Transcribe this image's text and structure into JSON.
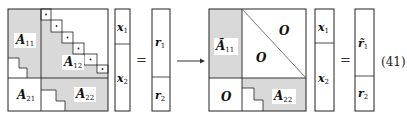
{
  "equation_number": "(41)",
  "colors": {
    "shade": "#d9d9d9",
    "line": "#222222",
    "background": "#ffffff"
  },
  "left_matrix": {
    "blocks": {
      "A11": {
        "base": "A",
        "sub": "11"
      },
      "A12": {
        "base": "A",
        "sub": "12"
      },
      "A21": {
        "base": "A",
        "sub": "21"
      },
      "A22": {
        "base": "A",
        "sub": "22"
      }
    },
    "diagonal_markers": "·"
  },
  "left_x_vector": {
    "top": {
      "base": "x",
      "sub": "1"
    },
    "bottom": {
      "base": "x",
      "sub": "2"
    }
  },
  "equals": "=",
  "left_r_vector": {
    "top": {
      "base": "r",
      "sub": "1"
    },
    "bottom": {
      "base": "r",
      "sub": "2"
    }
  },
  "arrow": "→",
  "right_matrix": {
    "blocks": {
      "A11_tilde": {
        "base": "Ã",
        "sub": "11"
      },
      "O_upper": "O",
      "O_lower": "O",
      "O_bottom_left": "O",
      "A22": {
        "base": "A",
        "sub": "22"
      }
    }
  },
  "right_x_vector": {
    "top": {
      "base": "x",
      "sub": "1"
    },
    "bottom": {
      "base": "x",
      "sub": "2"
    }
  },
  "right_r_vector": {
    "top": {
      "base": "r̃",
      "sub": "1"
    },
    "bottom": {
      "base": "r",
      "sub": "2"
    }
  }
}
